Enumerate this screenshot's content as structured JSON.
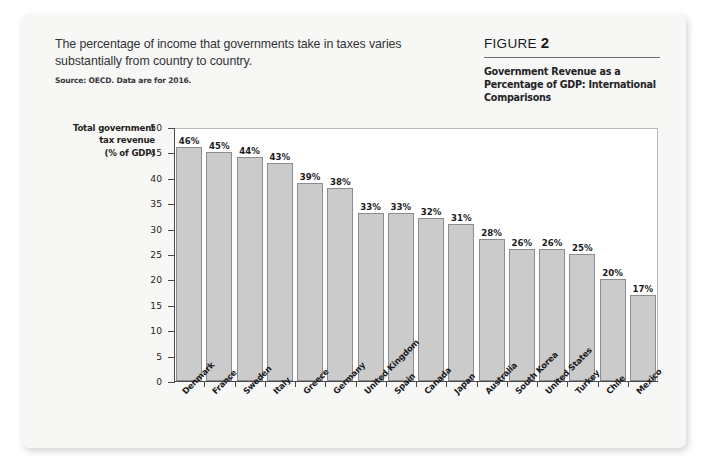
{
  "header": {
    "headline": "The percentage of income that governments take in taxes varies substantially from country to country.",
    "source_note": "Source: OECD. Data are for 2016."
  },
  "figure": {
    "label_word": "FIGURE",
    "number": "2",
    "title": "Government Revenue as a Percentage of GDP: International Comparisons"
  },
  "colors": {
    "page_background": "#f7f7f5",
    "plot_background": "#ffffff",
    "bar_fill": "#cbcbcb",
    "bar_stroke": "#8d8d90",
    "axis": "#4a4a4d",
    "text": "#1b1b1e"
  },
  "chart_data": {
    "type": "bar",
    "title": "Government Revenue as a Percentage of GDP: International Comparisons",
    "xlabel": "",
    "ylabel": "Total government tax revenue (% of GDP)",
    "ylabel_lines": [
      "Total government",
      "tax revenue",
      "(% of GDP)"
    ],
    "ylim": [
      0,
      50
    ],
    "ytick_step": 5,
    "yticks": [
      0,
      5,
      10,
      15,
      20,
      25,
      30,
      35,
      40,
      45,
      50
    ],
    "ytick_labels": [
      "0",
      "5",
      "10",
      "15",
      "20",
      "25",
      "30",
      "35",
      "40",
      "45",
      "50"
    ],
    "grid": false,
    "legend": false,
    "value_label_suffix": "%",
    "categories": [
      "Denmark",
      "France",
      "Sweden",
      "Italy",
      "Greece",
      "Germany",
      "United Kingdom",
      "Spain",
      "Canada",
      "Japan",
      "Australia",
      "South Korea",
      "United States",
      "Turkey",
      "Chile",
      "Mexico"
    ],
    "values": [
      46,
      45,
      44,
      43,
      39,
      38,
      33,
      33,
      32,
      31,
      28,
      26,
      26,
      25,
      20,
      17
    ],
    "value_labels": [
      "46%",
      "45%",
      "44%",
      "43%",
      "39%",
      "38%",
      "33%",
      "33%",
      "32%",
      "31%",
      "28%",
      "26%",
      "26%",
      "25%",
      "20%",
      "17%"
    ]
  }
}
